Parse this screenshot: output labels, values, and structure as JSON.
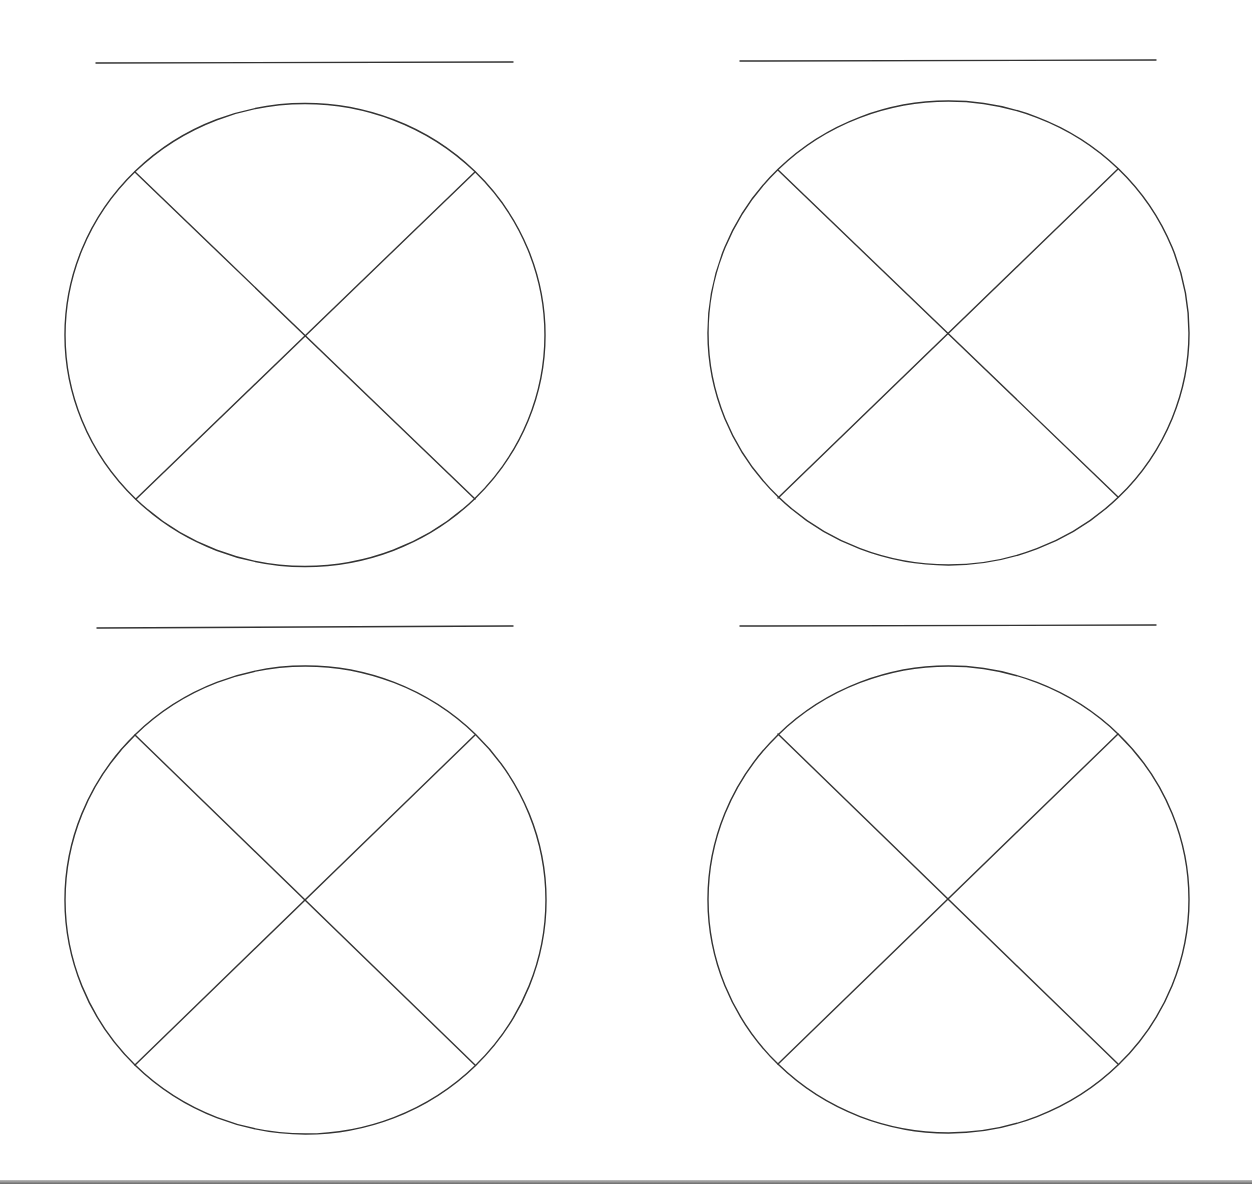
{
  "page": {
    "width": 1252,
    "height": 1184,
    "background": "#ffffff",
    "stroke_color": "#333333",
    "stroke_width": 1.4,
    "bottom_edge_color": "#6a6a6a"
  },
  "panels": [
    {
      "id": "top-left",
      "title_line": {
        "x1": 96,
        "y1": 63,
        "x2": 513,
        "y2": 62
      },
      "circle": {
        "cx": 305,
        "cy": 335,
        "rx": 240,
        "ry": 231.5
      },
      "divider_lines": [
        {
          "x1": 135,
          "y1": 172,
          "x2": 475,
          "y2": 499
        },
        {
          "x1": 475,
          "y1": 172,
          "x2": 136,
          "y2": 499
        }
      ]
    },
    {
      "id": "top-right",
      "title_line": {
        "x1": 740,
        "y1": 61,
        "x2": 1156,
        "y2": 60
      },
      "circle": {
        "cx": 948.5,
        "cy": 333,
        "rx": 240.5,
        "ry": 232
      },
      "divider_lines": [
        {
          "x1": 778,
          "y1": 170,
          "x2": 1118,
          "y2": 497
        },
        {
          "x1": 1118,
          "y1": 169,
          "x2": 778,
          "y2": 498
        }
      ]
    },
    {
      "id": "bottom-left",
      "title_line": {
        "x1": 97,
        "y1": 628,
        "x2": 513,
        "y2": 626
      },
      "circle": {
        "cx": 305.5,
        "cy": 900,
        "rx": 240.5,
        "ry": 234
      },
      "divider_lines": [
        {
          "x1": 135,
          "y1": 735,
          "x2": 475,
          "y2": 1065
        },
        {
          "x1": 475,
          "y1": 735,
          "x2": 135,
          "y2": 1065
        }
      ]
    },
    {
      "id": "bottom-right",
      "title_line": {
        "x1": 740,
        "y1": 626,
        "x2": 1156,
        "y2": 625
      },
      "circle": {
        "cx": 948.5,
        "cy": 899.5,
        "rx": 240.5,
        "ry": 233.5
      },
      "divider_lines": [
        {
          "x1": 778,
          "y1": 734,
          "x2": 1118,
          "y2": 1064
        },
        {
          "x1": 1118,
          "y1": 734,
          "x2": 778,
          "y2": 1064
        }
      ]
    }
  ]
}
